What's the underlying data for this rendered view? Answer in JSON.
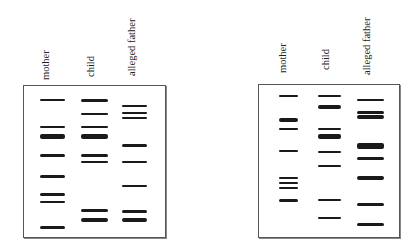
{
  "figure": {
    "band_color": "#1a1a1a",
    "border_color": "#555555"
  },
  "gels": [
    {
      "id": "left",
      "box": {
        "x": 23,
        "y": 85,
        "w": 141,
        "h": 151
      },
      "lanes": [
        {
          "label": "mother",
          "label_x": 40,
          "label_y": 80,
          "x": 40,
          "w": 25,
          "bands": [
            [
              100,
              2
            ],
            [
              127,
              2
            ],
            [
              136,
              5
            ],
            [
              155,
              3
            ],
            [
              176,
              3
            ],
            [
              194,
              3
            ],
            [
              202,
              2
            ],
            [
              227,
              3
            ]
          ]
        },
        {
          "label": "child",
          "label_x": 85,
          "label_y": 77,
          "x": 81,
          "w": 27,
          "bands": [
            [
              100,
              3
            ],
            [
              114,
              2
            ],
            [
              127,
              2
            ],
            [
              136,
              5
            ],
            [
              155,
              3
            ],
            [
              162,
              2
            ],
            [
              210,
              3
            ],
            [
              220,
              4
            ]
          ]
        },
        {
          "label": "alleged father",
          "label_x": 126,
          "label_y": 76,
          "x": 122,
          "w": 25,
          "bands": [
            [
              106,
              2
            ],
            [
              113,
              2
            ],
            [
              118,
              2
            ],
            [
              145,
              3
            ],
            [
              162,
              2
            ],
            [
              186,
              2
            ],
            [
              211,
              3
            ],
            [
              220,
              4
            ]
          ]
        }
      ]
    },
    {
      "id": "right",
      "box": {
        "x": 258,
        "y": 84,
        "w": 140,
        "h": 152
      },
      "lanes": [
        {
          "label": "mother",
          "label_x": 277,
          "label_y": 73,
          "x": 279,
          "w": 19,
          "bands": [
            [
              96,
              2
            ],
            [
              120,
              4
            ],
            [
              129,
              2
            ],
            [
              151,
              2
            ],
            [
              178,
              2
            ],
            [
              183,
              2
            ],
            [
              188,
              2
            ],
            [
              200,
              3
            ]
          ]
        },
        {
          "label": "child",
          "label_x": 320,
          "label_y": 70,
          "x": 318,
          "w": 23,
          "bands": [
            [
              96,
              2
            ],
            [
              107,
              4
            ],
            [
              129,
              2
            ],
            [
              136,
              5
            ],
            [
              152,
              2
            ],
            [
              166,
              2
            ],
            [
              200,
              2
            ],
            [
              218,
              2
            ]
          ]
        },
        {
          "label": "alleged father",
          "label_x": 361,
          "label_y": 75,
          "x": 357,
          "w": 27,
          "bands": [
            [
              100,
              2
            ],
            [
              112,
              3
            ],
            [
              117,
              4
            ],
            [
              146,
              6
            ],
            [
              158,
              3
            ],
            [
              178,
              4
            ],
            [
              204,
              3
            ],
            [
              224,
              3
            ]
          ]
        }
      ]
    }
  ]
}
